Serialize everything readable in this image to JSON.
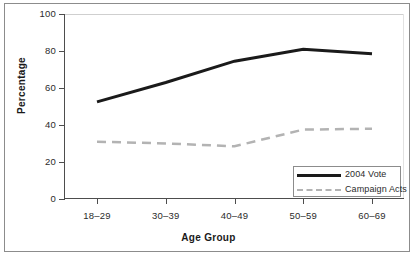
{
  "chart_data": {
    "type": "line",
    "title": "",
    "xlabel": "Age Group",
    "ylabel": "Percentage",
    "categories": [
      "18–29",
      "30–39",
      "40–49",
      "50–59",
      "60–69"
    ],
    "yticks": [
      0,
      20,
      40,
      60,
      80,
      100
    ],
    "ylim": [
      0,
      100
    ],
    "grid": false,
    "legend_position": "bottom-right",
    "series": [
      {
        "name": "2004 Vote",
        "style": "solid",
        "color": "#1a1a1a",
        "width": 3,
        "values": [
          52.5,
          63,
          74.5,
          81,
          78.5
        ]
      },
      {
        "name": "Campaign Acts",
        "style": "dashed",
        "color": "#b3b3b3",
        "width": 2.5,
        "values": [
          31,
          30,
          28.5,
          37.5,
          38
        ]
      }
    ]
  },
  "axis": {
    "ylabels": [
      "100",
      "80",
      "60",
      "40",
      "20",
      "0"
    ]
  },
  "legend": {
    "entries": [
      {
        "label": "2004 Vote"
      },
      {
        "label": "Campaign Acts"
      }
    ]
  }
}
